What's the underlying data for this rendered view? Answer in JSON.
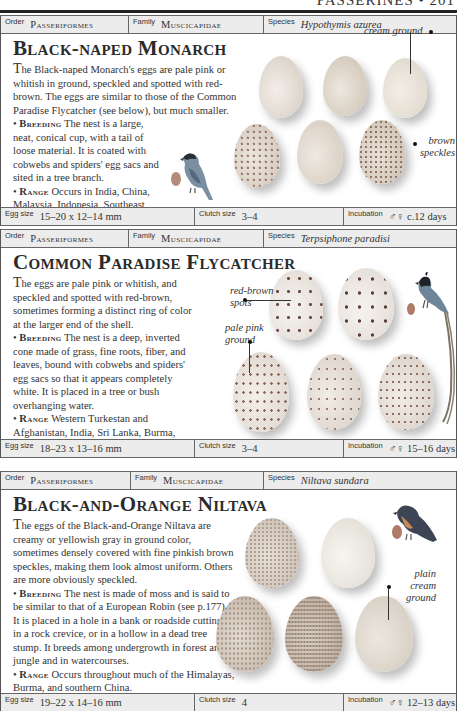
{
  "page": {
    "running_head": "PASSERINES • 201"
  },
  "entries": [
    {
      "order_label": "Order",
      "order": "Passeriformes",
      "family_label": "Family",
      "family": "Muscicapidae",
      "species_label": "Species",
      "species": "Hypothymis azurea",
      "title": "Black-naped Monarch",
      "description": "he Black-naped Monarch's eggs are pale pink or whitish in ground, speckled and spotted with red-brown. The eggs are similar to those of the Common Paradise Flycatcher (see below), but much smaller.",
      "description_initial": "T",
      "breeding_label": "Breeding",
      "breeding": " The nest is a large, neat, conical cup, with a tail of loose material. It is coated with cobwebs and spiders' egg sacs and sited in a tree branch.",
      "range_label": "Range",
      "range": " Occurs in India, China, Malaysia, Indonesia, Southeast Asia, and Burma.",
      "annotations": [
        "cream ground",
        "brown speckles"
      ],
      "egg_size_label": "Egg size",
      "egg_size": "15–20 x 12–14 mm",
      "clutch_size_label": "Clutch size",
      "clutch_size": "3–4",
      "incubation_label": "Incubation",
      "incubation": "♂♀ c.12 days"
    },
    {
      "order_label": "Order",
      "order": "Passeriformes",
      "family_label": "Family",
      "family": "Muscicapidae",
      "species_label": "Species",
      "species": "Terpsiphone paradisi",
      "title": "Common Paradise Flycatcher",
      "description": "he eggs are pale pink or whitish, and speckled and spotted with red-brown, sometimes forming a distinct ring of color at the larger end of the shell.",
      "description_initial": "T",
      "breeding_label": "Breeding",
      "breeding": " The nest is a deep, inverted cone made of grass, fine roots, fiber, and leaves, bound with cobwebs and spiders' egg sacs so that it appears completely white. It is placed in a tree or bush overhanging water.",
      "range_label": "Range",
      "range": " Western Turkestan and Afghanistan, India, Sri Lanka, Burma, China, Southeast Asia, and Malaysia.",
      "annotations": [
        "red-brown spots",
        "pale pink ground"
      ],
      "egg_size_label": "Egg size",
      "egg_size": "18–23 x 13–16 mm",
      "clutch_size_label": "Clutch size",
      "clutch_size": "3–4",
      "incubation_label": "Incubation",
      "incubation": "♂♀ 15–16 days"
    },
    {
      "order_label": "Order",
      "order": "Passeriformes",
      "family_label": "Family",
      "family": "Muscicapidae",
      "species_label": "Species",
      "species": "Niltava sundara",
      "title": "Black-and-Orange Niltava",
      "description": "he eggs of the Black-and-Orange Niltava are creamy or yellowish gray in ground color, sometimes densely covered with fine pinkish brown speckles, making them look almost uniform. Others are more obviously speckled.",
      "description_initial": "T",
      "breeding_label": "Breeding",
      "breeding": " The nest is made of moss and is said to be similar to that of a European Robin (see p.177). It is placed in a hole in a bank or roadside cutting, in a rock crevice, or in a hollow in a dead tree stump. It breeds among undergrowth in forest and jungle and in watercourses.",
      "range_label": "Range",
      "range": " Occurs throughout much of the Himalayas, Burma, and southern China.",
      "annotations": [
        "plain cream ground"
      ],
      "egg_size_label": "Egg size",
      "egg_size": "19–22 x 14–16 mm",
      "clutch_size_label": "Clutch size",
      "clutch_size": "4",
      "incubation_label": "Incubation",
      "incubation": "♂♀ 12–13 days"
    }
  ],
  "colors": {
    "bar_bg": "#ececec",
    "rule": "#222222",
    "text": "#2b2b2b"
  }
}
